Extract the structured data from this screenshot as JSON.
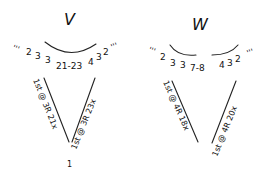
{
  "diagrams": [
    {
      "id": "V",
      "title": "V",
      "top_sequence": {
        "left_ticks": "'''",
        "left_numbers": [
          "2",
          "3",
          "3"
        ],
        "center": "21-23",
        "right_numbers": [
          "4",
          "3",
          "2"
        ],
        "right_ticks": "'''"
      },
      "left_leg_label": "1st @ 3R 21x",
      "right_leg_label": "1st @ 3R 23x",
      "bottom_mark": "1"
    },
    {
      "id": "W",
      "title": "W",
      "top_sequence": {
        "left_ticks": "'''",
        "left_numbers": [
          "2",
          "3",
          "3"
        ],
        "center": "7-8",
        "right_numbers": [
          "4",
          "3",
          "2"
        ],
        "right_ticks": "'''"
      },
      "left_leg_label": "1st @ 4R 18x",
      "right_leg_label": "1st @ 4R 20x",
      "bottom_mark": ""
    }
  ]
}
